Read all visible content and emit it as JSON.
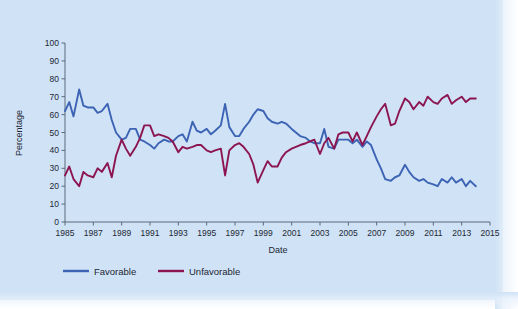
{
  "figure": {
    "background_color": "#cfe2f6",
    "plot_background_color": "#cfe2f6"
  },
  "chart_data": {
    "type": "line",
    "title": "",
    "xlabel": "Date",
    "ylabel": "Percentage",
    "xlim": [
      1985,
      2015
    ],
    "ylim": [
      0,
      100
    ],
    "grid": false,
    "legend_position": "bottom-left",
    "x_tick_labels": [
      "1985",
      "1987",
      "1989",
      "1991",
      "1993",
      "1995",
      "1997",
      "1999",
      "2001",
      "2003",
      "2005",
      "2007",
      "2009",
      "2011",
      "2013",
      "2015"
    ],
    "x_tick_values": [
      1985,
      1987,
      1989,
      1991,
      1993,
      1995,
      1997,
      1999,
      2001,
      2003,
      2005,
      2007,
      2009,
      2011,
      2013,
      2015
    ],
    "y_tick_labels": [
      "0",
      "10",
      "20",
      "30",
      "40",
      "50",
      "60",
      "70",
      "80",
      "90",
      "100"
    ],
    "y_tick_values": [
      0,
      10,
      20,
      30,
      40,
      50,
      60,
      70,
      80,
      90,
      100
    ],
    "series": [
      {
        "name": "Favorable",
        "color": "#3c63b4",
        "x": [
          1985.0,
          1985.3,
          1985.6,
          1986.0,
          1986.3,
          1986.6,
          1987.0,
          1987.3,
          1987.6,
          1988.0,
          1988.3,
          1988.6,
          1989.0,
          1989.3,
          1989.6,
          1990.0,
          1990.3,
          1990.6,
          1991.0,
          1991.3,
          1991.6,
          1992.0,
          1992.3,
          1992.6,
          1993.0,
          1993.3,
          1993.6,
          1994.0,
          1994.3,
          1994.6,
          1995.0,
          1995.3,
          1995.6,
          1996.0,
          1996.3,
          1996.6,
          1997.0,
          1997.3,
          1997.6,
          1998.0,
          1998.3,
          1998.6,
          1999.0,
          1999.3,
          1999.6,
          2000.0,
          2000.3,
          2000.6,
          2001.0,
          2001.3,
          2001.6,
          2002.0,
          2002.3,
          2002.6,
          2003.0,
          2003.3,
          2003.6,
          2004.0,
          2004.3,
          2004.6,
          2005.0,
          2005.3,
          2005.6,
          2006.0,
          2006.3,
          2006.6,
          2007.0,
          2007.3,
          2007.6,
          2008.0,
          2008.3,
          2008.6,
          2009.0,
          2009.3,
          2009.6,
          2010.0,
          2010.3,
          2010.6,
          2011.0,
          2011.3,
          2011.6,
          2012.0,
          2012.3,
          2012.6,
          2013.0,
          2013.3,
          2013.6,
          2014.0
        ],
        "y": [
          62,
          67,
          59,
          74,
          65,
          64,
          64,
          61,
          62,
          66,
          57,
          50,
          46,
          47,
          52,
          52,
          46,
          45,
          43,
          41,
          44,
          46,
          45,
          45,
          48,
          49,
          45,
          56,
          51,
          50,
          52,
          49,
          51,
          54,
          66,
          53,
          48,
          48,
          52,
          56,
          60,
          63,
          62,
          58,
          56,
          55,
          56,
          55,
          52,
          50,
          48,
          47,
          45,
          44,
          44,
          52,
          42,
          41,
          46,
          46,
          46,
          44,
          46,
          42,
          45,
          43,
          35,
          30,
          24,
          23,
          25,
          26,
          32,
          28,
          25,
          23,
          24,
          22,
          21,
          20,
          24,
          22,
          25,
          22,
          24,
          20,
          23,
          20
        ]
      },
      {
        "name": "Unfavorable",
        "color": "#8c1551",
        "x": [
          1985.0,
          1985.3,
          1985.6,
          1986.0,
          1986.3,
          1986.6,
          1987.0,
          1987.3,
          1987.6,
          1988.0,
          1988.3,
          1988.6,
          1989.0,
          1989.3,
          1989.6,
          1990.0,
          1990.3,
          1990.6,
          1991.0,
          1991.3,
          1991.6,
          1992.0,
          1992.3,
          1992.6,
          1993.0,
          1993.3,
          1993.6,
          1994.0,
          1994.3,
          1994.6,
          1995.0,
          1995.3,
          1995.6,
          1996.0,
          1996.3,
          1996.6,
          1997.0,
          1997.3,
          1997.6,
          1998.0,
          1998.3,
          1998.6,
          1999.0,
          1999.3,
          1999.6,
          2000.0,
          2000.3,
          2000.6,
          2001.0,
          2001.3,
          2001.6,
          2002.0,
          2002.3,
          2002.6,
          2003.0,
          2003.3,
          2003.6,
          2004.0,
          2004.3,
          2004.6,
          2005.0,
          2005.3,
          2005.6,
          2006.0,
          2006.3,
          2006.6,
          2007.0,
          2007.3,
          2007.6,
          2008.0,
          2008.3,
          2008.6,
          2009.0,
          2009.3,
          2009.6,
          2010.0,
          2010.3,
          2010.6,
          2011.0,
          2011.3,
          2011.6,
          2012.0,
          2012.3,
          2012.6,
          2013.0,
          2013.3,
          2013.6,
          2014.0
        ],
        "y": [
          26,
          31,
          24,
          20,
          28,
          26,
          25,
          30,
          28,
          33,
          25,
          37,
          46,
          41,
          37,
          42,
          47,
          54,
          54,
          48,
          49,
          48,
          47,
          45,
          39,
          42,
          41,
          42,
          43,
          43,
          40,
          39,
          40,
          41,
          26,
          40,
          43,
          44,
          42,
          38,
          32,
          22,
          29,
          34,
          31,
          31,
          36,
          39,
          41,
          42,
          43,
          44,
          45,
          46,
          38,
          44,
          47,
          41,
          49,
          50,
          50,
          45,
          50,
          43,
          48,
          53,
          59,
          63,
          66,
          54,
          55,
          62,
          69,
          67,
          63,
          67,
          65,
          70,
          67,
          66,
          69,
          71,
          66,
          68,
          70,
          67,
          69,
          69
        ]
      }
    ]
  },
  "legend": {
    "items": [
      {
        "label": "Favorable",
        "color": "#3c63b4"
      },
      {
        "label": "Unfavorable",
        "color": "#8c1551"
      }
    ]
  }
}
